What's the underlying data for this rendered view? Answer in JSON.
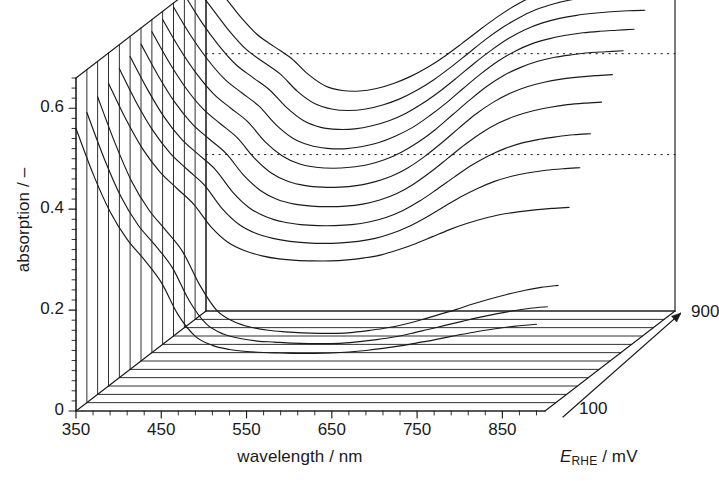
{
  "figure": {
    "kind": "3d-waterfall-spectra",
    "background": "#ffffff",
    "line_color": "#1a1a1a"
  },
  "axes": {
    "y": {
      "title": "absorption / –",
      "ticks": [
        "0",
        "0.2",
        "0.4",
        "0.6"
      ],
      "tick_values": [
        0,
        0.2,
        0.4,
        0.6
      ],
      "range": [
        0,
        0.66
      ],
      "minor_tick_step": 0.02
    },
    "x": {
      "title": "wavelength / nm",
      "ticks": [
        "350",
        "450",
        "550",
        "650",
        "750",
        "850"
      ],
      "tick_values": [
        350,
        450,
        550,
        650,
        750,
        850
      ],
      "range": [
        350,
        900
      ],
      "minor_tick_step": 20
    },
    "z": {
      "title_parts": {
        "symbol": "E",
        "subscript": "RHE",
        "units": "/ mV"
      },
      "title": "E_RHE / mV",
      "front_label": "100",
      "back_label": "900",
      "range": [
        100,
        900
      ],
      "arrow": "depth-axis-arrow"
    }
  },
  "reference_lines": {
    "count": 2,
    "style": "dotted",
    "values": [
      0.31,
      0.51
    ]
  },
  "chart_data": {
    "type": "line",
    "title": "",
    "xlabel": "wavelength / nm",
    "ylabel": "absorption / –",
    "zlabel": "E_RHE / mV",
    "xlim": [
      350,
      900
    ],
    "ylim": [
      0,
      0.66
    ],
    "zlim": [
      100,
      900
    ],
    "grid": false,
    "legend": "none",
    "projection": "3d-waterfall",
    "x": [
      350,
      370,
      390,
      410,
      430,
      450,
      470,
      490,
      510,
      530,
      550,
      570,
      590,
      610,
      630,
      650,
      670,
      690,
      710,
      730,
      750,
      770,
      790,
      810,
      830,
      850,
      870,
      890
    ],
    "series": [
      {
        "name": "100 mV",
        "z": 100,
        "values": [
          0.56,
          0.47,
          0.395,
          0.34,
          0.3,
          0.255,
          0.19,
          0.148,
          0.13,
          0.122,
          0.118,
          0.116,
          0.115,
          0.114,
          0.114,
          0.115,
          0.117,
          0.12,
          0.124,
          0.129,
          0.135,
          0.141,
          0.148,
          0.154,
          0.16,
          0.165,
          0.169,
          0.172
        ]
      },
      {
        "name": "167 mV",
        "z": 167,
        "values": [
          0.575,
          0.485,
          0.408,
          0.352,
          0.312,
          0.268,
          0.202,
          0.156,
          0.136,
          0.127,
          0.122,
          0.12,
          0.118,
          0.117,
          0.117,
          0.118,
          0.121,
          0.125,
          0.13,
          0.137,
          0.145,
          0.153,
          0.161,
          0.169,
          0.176,
          0.182,
          0.187,
          0.19
        ]
      },
      {
        "name": "233 mV",
        "z": 233,
        "values": [
          0.59,
          0.5,
          0.422,
          0.366,
          0.325,
          0.282,
          0.216,
          0.166,
          0.144,
          0.133,
          0.127,
          0.124,
          0.122,
          0.121,
          0.121,
          0.123,
          0.127,
          0.132,
          0.139,
          0.148,
          0.158,
          0.168,
          0.179,
          0.189,
          0.198,
          0.206,
          0.212,
          0.216
        ]
      },
      {
        "name": "300 mV",
        "z": 300,
        "values": [
          0.6,
          0.53,
          0.47,
          0.425,
          0.392,
          0.36,
          0.316,
          0.285,
          0.268,
          0.258,
          0.252,
          0.249,
          0.248,
          0.248,
          0.25,
          0.254,
          0.26,
          0.27,
          0.282,
          0.296,
          0.31,
          0.322,
          0.332,
          0.34,
          0.345,
          0.349,
          0.352,
          0.354
        ]
      },
      {
        "name": "367 mV",
        "z": 367,
        "values": [
          0.612,
          0.545,
          0.488,
          0.444,
          0.412,
          0.381,
          0.336,
          0.304,
          0.286,
          0.276,
          0.27,
          0.267,
          0.266,
          0.267,
          0.27,
          0.276,
          0.286,
          0.3,
          0.318,
          0.338,
          0.358,
          0.375,
          0.389,
          0.399,
          0.406,
          0.411,
          0.414,
          0.416
        ]
      },
      {
        "name": "433 mV",
        "z": 433,
        "values": [
          0.62,
          0.556,
          0.5,
          0.457,
          0.426,
          0.396,
          0.352,
          0.32,
          0.302,
          0.292,
          0.287,
          0.285,
          0.285,
          0.287,
          0.292,
          0.301,
          0.315,
          0.334,
          0.357,
          0.381,
          0.404,
          0.423,
          0.438,
          0.449,
          0.456,
          0.461,
          0.465,
          0.467
        ]
      },
      {
        "name": "500 mV",
        "z": 500,
        "values": [
          0.628,
          0.566,
          0.512,
          0.47,
          0.44,
          0.411,
          0.369,
          0.338,
          0.32,
          0.311,
          0.307,
          0.306,
          0.307,
          0.311,
          0.319,
          0.332,
          0.351,
          0.375,
          0.402,
          0.429,
          0.453,
          0.472,
          0.486,
          0.496,
          0.503,
          0.508,
          0.511,
          0.513
        ]
      },
      {
        "name": "567 mV",
        "z": 567,
        "values": [
          0.636,
          0.576,
          0.524,
          0.483,
          0.454,
          0.426,
          0.386,
          0.356,
          0.339,
          0.331,
          0.328,
          0.328,
          0.331,
          0.338,
          0.349,
          0.366,
          0.389,
          0.416,
          0.445,
          0.473,
          0.496,
          0.514,
          0.527,
          0.536,
          0.542,
          0.546,
          0.549,
          0.551
        ]
      },
      {
        "name": "633 mV",
        "z": 633,
        "values": [
          0.644,
          0.586,
          0.536,
          0.496,
          0.468,
          0.441,
          0.402,
          0.374,
          0.358,
          0.351,
          0.349,
          0.351,
          0.356,
          0.366,
          0.381,
          0.401,
          0.426,
          0.455,
          0.484,
          0.511,
          0.533,
          0.549,
          0.561,
          0.569,
          0.574,
          0.578,
          0.58,
          0.582
        ]
      },
      {
        "name": "700 mV",
        "z": 700,
        "values": [
          0.652,
          0.596,
          0.548,
          0.509,
          0.482,
          0.456,
          0.419,
          0.392,
          0.378,
          0.372,
          0.371,
          0.375,
          0.383,
          0.396,
          0.413,
          0.436,
          0.462,
          0.491,
          0.519,
          0.544,
          0.564,
          0.579,
          0.589,
          0.596,
          0.601,
          0.604,
          0.606,
          0.608
        ]
      },
      {
        "name": "767 mV",
        "z": 767,
        "values": [
          0.66,
          0.606,
          0.56,
          0.522,
          0.496,
          0.471,
          0.436,
          0.41,
          0.397,
          0.393,
          0.394,
          0.4,
          0.41,
          0.425,
          0.445,
          0.469,
          0.496,
          0.524,
          0.55,
          0.573,
          0.591,
          0.604,
          0.613,
          0.619,
          0.623,
          0.626,
          0.628,
          0.629
        ]
      },
      {
        "name": "833 mV",
        "z": 833,
        "values": [
          0.668,
          0.616,
          0.572,
          0.535,
          0.51,
          0.486,
          0.452,
          0.428,
          0.417,
          0.414,
          0.417,
          0.425,
          0.437,
          0.454,
          0.475,
          0.5,
          0.527,
          0.554,
          0.578,
          0.598,
          0.614,
          0.625,
          0.633,
          0.638,
          0.641,
          0.644,
          0.645,
          0.646
        ]
      },
      {
        "name": "900 mV",
        "z": 900,
        "values": [
          0.676,
          0.626,
          0.584,
          0.548,
          0.524,
          0.501,
          0.469,
          0.446,
          0.437,
          0.436,
          0.441,
          0.451,
          0.465,
          0.483,
          0.505,
          0.53,
          0.556,
          0.581,
          0.603,
          0.621,
          0.635,
          0.645,
          0.652,
          0.656,
          0.659,
          0.661,
          0.662,
          0.663
        ]
      }
    ]
  }
}
